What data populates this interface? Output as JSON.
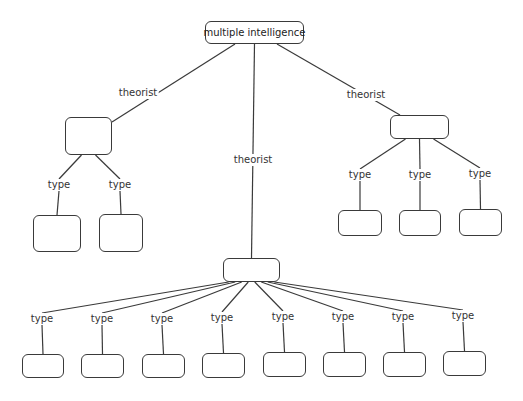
{
  "diagram": {
    "type": "concept-map",
    "root": {
      "text": "multiple intelligence",
      "box": [
        205,
        21,
        99,
        23
      ]
    },
    "line_color": "#3a3a3a",
    "branches": [
      {
        "id": "left",
        "link_label": "theorist",
        "label_pos": [
          138,
          93
        ],
        "text": "",
        "box": [
          65,
          117,
          47,
          38
        ],
        "children": [
          {
            "link_label": "type",
            "label_pos": [
              59,
              185
            ],
            "text": "",
            "box": [
              33,
              215,
              48,
              37
            ]
          },
          {
            "link_label": "type",
            "label_pos": [
              120,
              185
            ],
            "text": "",
            "box": [
              99,
              214,
              44,
              38
            ]
          }
        ]
      },
      {
        "id": "center",
        "link_label": "theorist",
        "label_pos": [
          253,
          160
        ],
        "text": "",
        "box": [
          223,
          258,
          57,
          24
        ],
        "children": [
          {
            "link_label": "type",
            "label_pos": [
              42,
              319
            ],
            "text": "",
            "box": [
              22,
              354,
              42,
              24
            ]
          },
          {
            "link_label": "type",
            "label_pos": [
              102,
              319
            ],
            "text": "",
            "box": [
              81,
              354,
              43,
              24
            ]
          },
          {
            "link_label": "type",
            "label_pos": [
              162,
              319
            ],
            "text": "",
            "box": [
              142,
              354,
              43,
              24
            ]
          },
          {
            "link_label": "type",
            "label_pos": [
              222,
              318
            ],
            "text": "",
            "box": [
              202,
              353,
              43,
              25
            ]
          },
          {
            "link_label": "type",
            "label_pos": [
              283,
              317
            ],
            "text": "",
            "box": [
              263,
              352,
              43,
              25
            ]
          },
          {
            "link_label": "type",
            "label_pos": [
              343,
              317
            ],
            "text": "",
            "box": [
              323,
              352,
              43,
              25
            ]
          },
          {
            "link_label": "type",
            "label_pos": [
              403,
              317
            ],
            "text": "",
            "box": [
              383,
              352,
              43,
              25
            ]
          },
          {
            "link_label": "type",
            "label_pos": [
              463,
              316
            ],
            "text": "",
            "box": [
              443,
              351,
              43,
              25
            ]
          }
        ]
      },
      {
        "id": "right",
        "link_label": "theorist",
        "label_pos": [
          366,
          95
        ],
        "text": "",
        "box": [
          390,
          115,
          59,
          24
        ],
        "children": [
          {
            "link_label": "type",
            "label_pos": [
              360,
              175
            ],
            "text": "",
            "box": [
              338,
              210,
              44,
              26
            ]
          },
          {
            "link_label": "type",
            "label_pos": [
              420,
              175
            ],
            "text": "",
            "box": [
              399,
              210,
              42,
              26
            ]
          },
          {
            "link_label": "type",
            "label_pos": [
              480,
              174
            ],
            "text": "",
            "box": [
              459,
              209,
              43,
              27
            ]
          }
        ]
      }
    ]
  }
}
